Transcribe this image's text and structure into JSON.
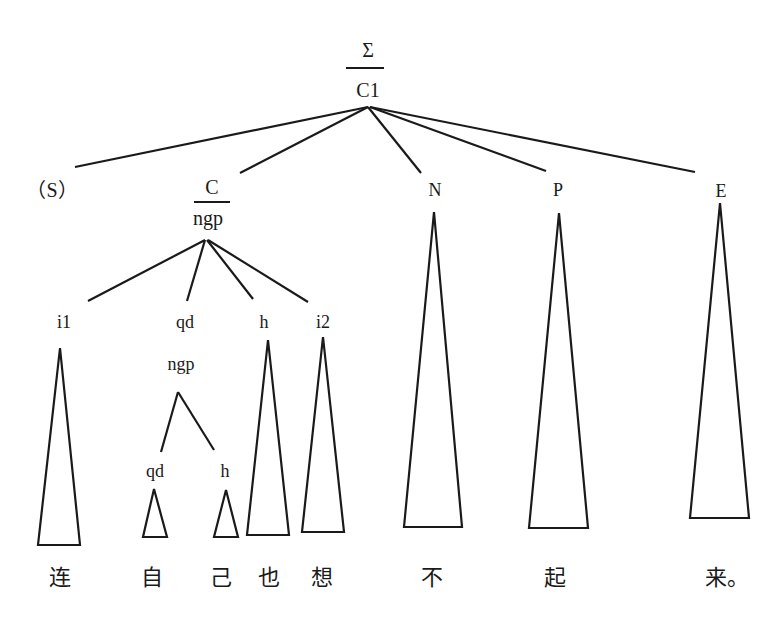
{
  "diagram": {
    "type": "syntax-tree",
    "root": {
      "top": "Σ",
      "bottom": "C1"
    },
    "level1": [
      {
        "id": "S",
        "label": "（S）"
      },
      {
        "id": "C",
        "top": "C",
        "bottom": "ngp"
      },
      {
        "id": "N",
        "label": "N"
      },
      {
        "id": "P",
        "label": "P"
      },
      {
        "id": "E",
        "label": "E"
      }
    ],
    "level2": [
      {
        "id": "i1",
        "label": "i1"
      },
      {
        "id": "qd",
        "label": "qd",
        "sub": "ngp"
      },
      {
        "id": "h",
        "label": "h"
      },
      {
        "id": "i2",
        "label": "i2"
      }
    ],
    "level3": [
      {
        "id": "qd2",
        "label": "qd"
      },
      {
        "id": "h2",
        "label": "h"
      }
    ],
    "words": [
      "连",
      "自",
      "己",
      "也",
      "想",
      "不",
      "起",
      "来。"
    ]
  }
}
